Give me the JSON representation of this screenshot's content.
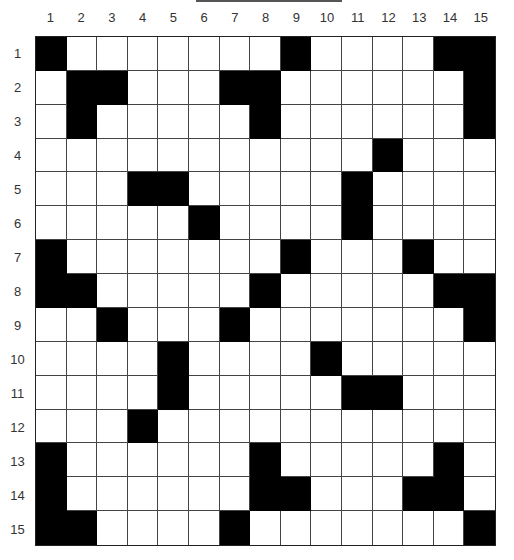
{
  "puzzle": {
    "type": "crossword",
    "size": 15,
    "column_labels": [
      "1",
      "2",
      "3",
      "4",
      "5",
      "6",
      "7",
      "8",
      "9",
      "10",
      "11",
      "12",
      "13",
      "14",
      "15"
    ],
    "row_labels": [
      "1",
      "2",
      "3",
      "4",
      "5",
      "6",
      "7",
      "8",
      "9",
      "10",
      "11",
      "12",
      "13",
      "14",
      "15"
    ],
    "colors": {
      "black_cell": "#000000",
      "white_cell": "#ffffff"
    },
    "black_cells": {
      "1": [
        1,
        9,
        14,
        15
      ],
      "2": [
        2,
        3,
        7,
        8,
        15
      ],
      "3": [
        2,
        8,
        15
      ],
      "4": [
        12
      ],
      "5": [
        4,
        5,
        11
      ],
      "6": [
        6,
        11
      ],
      "7": [
        1,
        9,
        13
      ],
      "8": [
        1,
        2,
        8,
        14,
        15
      ],
      "9": [
        3,
        7,
        15
      ],
      "10": [
        5,
        10
      ],
      "11": [
        5,
        11,
        12
      ],
      "12": [
        4
      ],
      "13": [
        1,
        8,
        14
      ],
      "14": [
        1,
        8,
        9,
        13,
        14
      ],
      "15": [
        1,
        2,
        7,
        15
      ]
    }
  }
}
